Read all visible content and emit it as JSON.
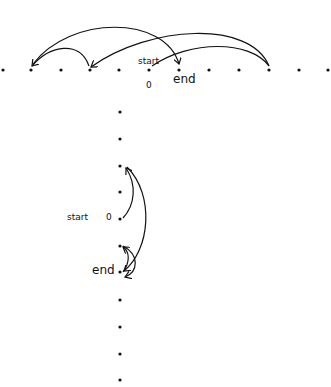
{
  "diagram": {
    "type": "number-line-jumps",
    "ink_color": "#111111",
    "background": "#ffffff",
    "horizontal_line": {
      "dot_count": 12,
      "dots_x": [
        3,
        31,
        61,
        90,
        119,
        149,
        179,
        209,
        239,
        269,
        299,
        328
      ],
      "y": 70,
      "zero_index": 5,
      "labels": {
        "start": "start",
        "zero": "0",
        "end": "end"
      },
      "jumps": [
        {
          "from_index": 5,
          "to_index": 9,
          "description": "start to far right"
        },
        {
          "from_index": 9,
          "to_index": 3,
          "description": "far right to left"
        },
        {
          "from_index": 3,
          "to_index": 1,
          "description": "short hop left"
        },
        {
          "from_index": 1,
          "to_index": 6,
          "description": "long arc back to end"
        }
      ]
    },
    "vertical_line": {
      "dot_count": 11,
      "x": 120,
      "dots_y": [
        112,
        139,
        166,
        192,
        219,
        246,
        272,
        300,
        327,
        354,
        380
      ],
      "zero_index": 4,
      "labels": {
        "start": "start",
        "zero": "0",
        "end": "end"
      },
      "jumps": [
        {
          "from_index": 4,
          "to_index": 2,
          "description": "start up two"
        },
        {
          "from_index": 2,
          "to_index": 6,
          "description": "down four"
        },
        {
          "from_index": 6,
          "to_index": 5,
          "description": "up one"
        },
        {
          "from_index": 5,
          "to_index": 6,
          "description": "down one to end"
        }
      ]
    }
  }
}
